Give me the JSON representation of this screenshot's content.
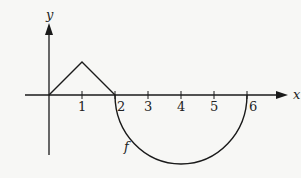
{
  "figure": {
    "function_label": "f",
    "x_axis_label": "x",
    "y_axis_label": "y",
    "x_ticks": [
      "1",
      "2",
      "3",
      "4",
      "5",
      "6"
    ],
    "stroke_color": "#1a1a1a",
    "background_color": "#f7f7f5"
  },
  "graph": {
    "segments": [
      {
        "type": "line",
        "from": [
          0,
          0
        ],
        "to": [
          1,
          1
        ]
      },
      {
        "type": "line",
        "from": [
          1,
          1
        ],
        "to": [
          2,
          0
        ]
      },
      {
        "type": "semicircle",
        "center": [
          4,
          0
        ],
        "radius": 2,
        "side": "below"
      }
    ]
  }
}
